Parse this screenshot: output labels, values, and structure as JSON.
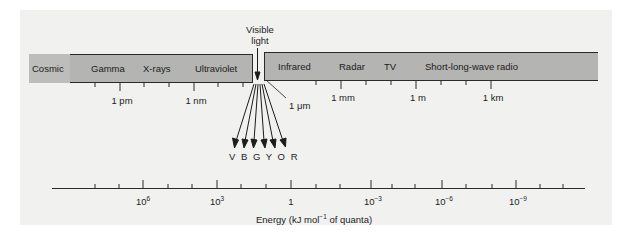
{
  "diagram": {
    "visible_light_label_line1": "Visible",
    "visible_light_label_line2": "light",
    "bands": [
      {
        "label": "Cosmic"
      },
      {
        "label": "Gamma"
      },
      {
        "label": "X-rays"
      },
      {
        "label": "Ultraviolet"
      },
      {
        "label": "Infrared"
      },
      {
        "label": "Radar"
      },
      {
        "label": "TV"
      },
      {
        "label": "Short-long-wave radio"
      }
    ],
    "wavelength_ticks": [
      {
        "label": "1 pm"
      },
      {
        "label": "1 nm"
      },
      {
        "label": "1 μm"
      },
      {
        "label": "1 mm"
      },
      {
        "label": "1 m"
      },
      {
        "label": "1 km"
      }
    ],
    "visible_colors": "V B G Y O R",
    "energy_axis": {
      "title_prefix": "Energy (kJ mol",
      "title_exp": "−1",
      "title_suffix": " of quanta)",
      "ticks": [
        {
          "base": "10",
          "exp": "6"
        },
        {
          "base": "10",
          "exp": "3"
        },
        {
          "base": "1",
          "exp": ""
        },
        {
          "base": "10",
          "exp": "−3"
        },
        {
          "base": "10",
          "exp": "−6"
        },
        {
          "base": "10",
          "exp": "−9"
        }
      ]
    },
    "colors": {
      "band_fill": "#b4b4b2",
      "cosmic_fill": "#bdbdbb",
      "line": "#2a2a2a",
      "paper": "#f1f1ef"
    }
  }
}
